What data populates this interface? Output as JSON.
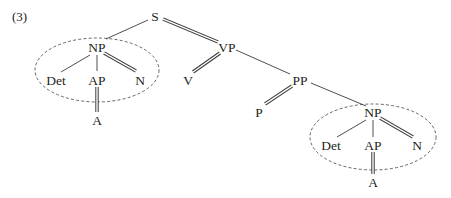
{
  "example_number": "(3)",
  "tree": {
    "root": "S",
    "nodes": {
      "s": "S",
      "np1": "NP",
      "vp": "VP",
      "det1": "Det",
      "ap1": "AP",
      "n1": "N",
      "a1": "A",
      "v": "V",
      "pp": "PP",
      "p": "P",
      "np2": "NP",
      "det2": "Det",
      "ap2": "AP",
      "n2": "N",
      "a2": "A"
    },
    "edges": [
      {
        "from": "S",
        "to": "NP",
        "style": "single"
      },
      {
        "from": "S",
        "to": "VP",
        "style": "double"
      },
      {
        "from": "NP",
        "to": "Det",
        "style": "single"
      },
      {
        "from": "NP",
        "to": "AP",
        "style": "single"
      },
      {
        "from": "NP",
        "to": "N",
        "style": "double"
      },
      {
        "from": "AP",
        "to": "A",
        "style": "double"
      },
      {
        "from": "VP",
        "to": "V",
        "style": "double"
      },
      {
        "from": "VP",
        "to": "PP",
        "style": "single"
      },
      {
        "from": "PP",
        "to": "P",
        "style": "double"
      },
      {
        "from": "PP",
        "to": "NP",
        "style": "single"
      },
      {
        "from": "NP",
        "to": "Det",
        "style": "single"
      },
      {
        "from": "NP",
        "to": "AP",
        "style": "single"
      },
      {
        "from": "NP",
        "to": "N",
        "style": "double"
      },
      {
        "from": "AP",
        "to": "A",
        "style": "double"
      }
    ],
    "circled_subtrees": [
      "NP (subject)",
      "NP (object of P)"
    ]
  }
}
